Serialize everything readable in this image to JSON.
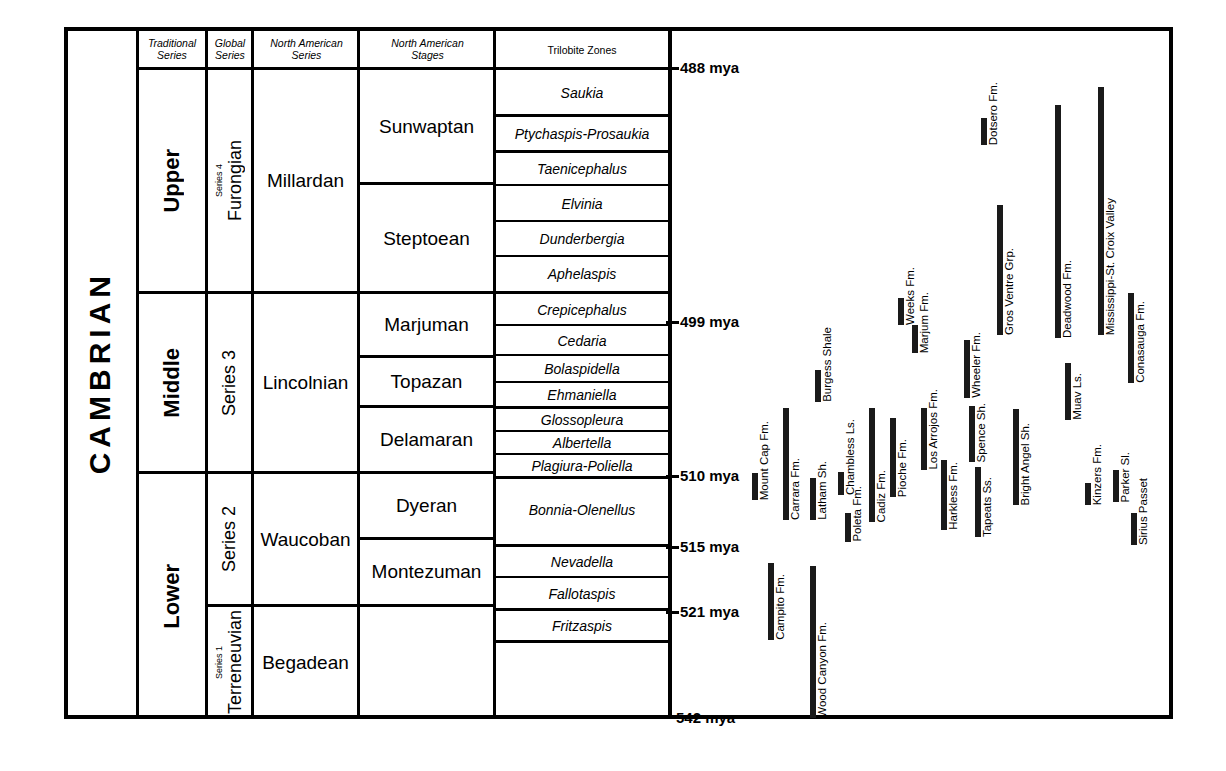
{
  "title": "CAMBRIAN",
  "columns": {
    "traditional_series": "Traditional\nSeries",
    "traditional_series_l1": "Traditional",
    "traditional_series_l2": "Series",
    "global_series_l1": "Global",
    "global_series_l2": "Series",
    "na_series_l1": "North American",
    "na_series_l2": "Series",
    "na_stages_l1": "North American",
    "na_stages_l2": "Stages",
    "trilobite_zones": "Trilobite Zones"
  },
  "traditional_series": [
    {
      "label": "Upper"
    },
    {
      "label": "Middle"
    },
    {
      "label": "Lower"
    }
  ],
  "global_series": [
    {
      "name": "Furongian",
      "sub": "Series 4"
    },
    {
      "name": "Series 3",
      "sub": ""
    },
    {
      "name": "Series 2",
      "sub": ""
    },
    {
      "name": "Terreneuvian",
      "sub": "Series 1"
    }
  ],
  "na_series": [
    {
      "label": "Millardan"
    },
    {
      "label": "Lincolnian"
    },
    {
      "label": "Waucoban"
    },
    {
      "label": "Begadean"
    }
  ],
  "na_stages": [
    {
      "label": "Sunwaptan"
    },
    {
      "label": "Steptoean"
    },
    {
      "label": "Marjuman"
    },
    {
      "label": "Topazan"
    },
    {
      "label": "Delamaran"
    },
    {
      "label": "Dyeran"
    },
    {
      "label": "Montezuman"
    }
  ],
  "trilobite_zones": [
    {
      "label": "Saukia"
    },
    {
      "label": "Ptychaspis-Prosaukia"
    },
    {
      "label": "Taenicephalus"
    },
    {
      "label": "Elvinia"
    },
    {
      "label": "Dunderbergia"
    },
    {
      "label": "Aphelaspis"
    },
    {
      "label": "Crepicephalus"
    },
    {
      "label": "Cedaria"
    },
    {
      "label": "Bolaspidella"
    },
    {
      "label": "Ehmaniella"
    },
    {
      "label": "Glossopleura"
    },
    {
      "label": "Albertella"
    },
    {
      "label": "Plagiura-Poliella"
    },
    {
      "label": "Bonnia-Olenellus"
    },
    {
      "label": "Nevadella"
    },
    {
      "label": "Fallotaspis"
    },
    {
      "label": "Fritzaspis"
    }
  ],
  "time_axis": [
    {
      "label": "488 mya",
      "value": 488
    },
    {
      "label": "499 mya",
      "value": 499
    },
    {
      "label": "510 mya",
      "value": 510
    },
    {
      "label": "515 mya",
      "value": 515
    },
    {
      "label": "521 mya",
      "value": 521
    },
    {
      "label": "542 mya",
      "value": 542
    }
  ],
  "formations": [
    {
      "label": "Mount Cap Fm."
    },
    {
      "label": "Carrara Fm."
    },
    {
      "label": "Latham Sh."
    },
    {
      "label": "Burgess Shale"
    },
    {
      "label": "Chambless Ls."
    },
    {
      "label": "Poleta Fm."
    },
    {
      "label": "Cadiz Fm."
    },
    {
      "label": "Pioche Fm."
    },
    {
      "label": "Weeks Fm."
    },
    {
      "label": "Marjum Fm."
    },
    {
      "label": "Los Arrojos Fm."
    },
    {
      "label": "Harkless Fm."
    },
    {
      "label": "Wheeler Fm."
    },
    {
      "label": "Spence Sh."
    },
    {
      "label": "Tapeats Ss."
    },
    {
      "label": "Gros Ventre Grp."
    },
    {
      "label": "Bright Angel Sh."
    },
    {
      "label": "Dotsero Fm."
    },
    {
      "label": "Muav Ls."
    },
    {
      "label": "Deadwood Fm."
    },
    {
      "label": "Kinzers Fm."
    },
    {
      "label": "Mississippi-St. Croix Valley"
    },
    {
      "label": "Parker Sl."
    },
    {
      "label": "Conasauga Fm."
    },
    {
      "label": "Sirius Passet"
    },
    {
      "label": "Campito Fm."
    },
    {
      "label": "Wood Canyon Fm."
    }
  ],
  "chart_data": {
    "type": "bar",
    "xlabel": "",
    "ylabel": "Millions of years ago (mya)",
    "ylim": [
      488,
      542
    ],
    "grid": false,
    "orientation": "vertical-time",
    "axis_ticks": [
      488,
      499,
      510,
      515,
      521,
      542
    ],
    "series": [
      {
        "name": "Mount Cap Fm.",
        "x": 752,
        "top_px": 473,
        "bottom_px": 500
      },
      {
        "name": "Carrara Fm.",
        "x": 783,
        "top_px": 408,
        "bottom_px": 520
      },
      {
        "name": "Latham Sh.",
        "x": 810,
        "top_px": 478,
        "bottom_px": 520
      },
      {
        "name": "Burgess Shale",
        "x": 815,
        "top_px": 370,
        "bottom_px": 402
      },
      {
        "name": "Chambless Ls.",
        "x": 838,
        "top_px": 472,
        "bottom_px": 495
      },
      {
        "name": "Poleta Fm.",
        "x": 845,
        "top_px": 513,
        "bottom_px": 542
      },
      {
        "name": "Cadiz Fm.",
        "x": 869,
        "top_px": 408,
        "bottom_px": 522
      },
      {
        "name": "Pioche Fm.",
        "x": 890,
        "top_px": 418,
        "bottom_px": 497
      },
      {
        "name": "Weeks Fm.",
        "x": 898,
        "top_px": 298,
        "bottom_px": 325
      },
      {
        "name": "Marjum Fm.",
        "x": 912,
        "top_px": 325,
        "bottom_px": 353
      },
      {
        "name": "Los Arrojos Fm.",
        "x": 921,
        "top_px": 408,
        "bottom_px": 470
      },
      {
        "name": "Harkless Fm.",
        "x": 941,
        "top_px": 460,
        "bottom_px": 530
      },
      {
        "name": "Wheeler Fm.",
        "x": 964,
        "top_px": 340,
        "bottom_px": 398
      },
      {
        "name": "Spence Sh.",
        "x": 969,
        "top_px": 406,
        "bottom_px": 462
      },
      {
        "name": "Tapeats Ss.",
        "x": 975,
        "top_px": 467,
        "bottom_px": 537
      },
      {
        "name": "Gros Ventre Grp.",
        "x": 997,
        "top_px": 205,
        "bottom_px": 335
      },
      {
        "name": "Bright Angel Sh.",
        "x": 1013,
        "top_px": 409,
        "bottom_px": 505
      },
      {
        "name": "Dotsero Fm.",
        "x": 981,
        "top_px": 118,
        "bottom_px": 145
      },
      {
        "name": "Muav Ls.",
        "x": 1065,
        "top_px": 363,
        "bottom_px": 420
      },
      {
        "name": "Deadwood Fm.",
        "x": 1055,
        "top_px": 105,
        "bottom_px": 338
      },
      {
        "name": "Kinzers Fm.",
        "x": 1085,
        "top_px": 483,
        "bottom_px": 505
      },
      {
        "name": "Mississippi-St. Croix Valley",
        "x": 1098,
        "top_px": 87,
        "bottom_px": 335
      },
      {
        "name": "Parker Sl.",
        "x": 1113,
        "top_px": 470,
        "bottom_px": 502
      },
      {
        "name": "Conasauga Fm.",
        "x": 1128,
        "top_px": 293,
        "bottom_px": 383
      },
      {
        "name": "Sirius Passet",
        "x": 1131,
        "top_px": 513,
        "bottom_px": 545
      },
      {
        "name": "Campito Fm.",
        "x": 768,
        "top_px": 563,
        "bottom_px": 640
      },
      {
        "name": "Wood Canyon Fm.",
        "x": 810,
        "top_px": 566,
        "bottom_px": 718
      }
    ]
  }
}
